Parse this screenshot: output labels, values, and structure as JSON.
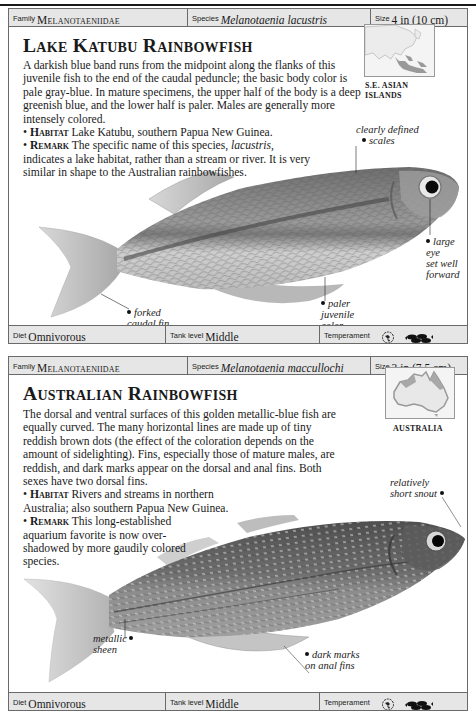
{
  "cards": [
    {
      "family_label": "Family",
      "family": "Melanotaeniidae",
      "species_label": "Species",
      "species": "Melanotaenia lacustris",
      "size_label": "Size",
      "size": "4 in (10 cm)",
      "title": "Lake Katubu Rainbowfish",
      "description": "A darkish blue band runs from the midpoint along the flanks of this juvenile fish to the end of the caudal peduncle; the basic body color is pale gray-blue. In mature specimens, the upper half of the body is a deep greenish blue, and the lower half is paler. Males are generally more intensely colored.",
      "habitat_label": "Habitat",
      "habitat": "Lake Katubu, southern Papua New Guinea.",
      "remark_label": "Remark",
      "remark_pre": "The specific name of this species, ",
      "remark_italic": "lacustris",
      "remark_post": ", indicates a lake habitat, rather than a stream or river. It is very similar in shape to the Australian rainbowfishes.",
      "map_label_1": "S.E. ASIAN",
      "map_label_2": "ISLANDS",
      "annotations": {
        "scales_1": "clearly defined",
        "scales_2": "scales",
        "eye_1": "large eye",
        "eye_2": "set well",
        "eye_3": "forward",
        "color_1": "paler",
        "color_2": "juvenile",
        "color_3": "color",
        "fin_1": "forked",
        "fin_2": "caudal fin"
      },
      "diet_label": "Diet",
      "diet": "Omnivorous",
      "tank_label": "Tank level",
      "tank": "Middle",
      "temperament_label": "Temperament",
      "temperament_icons": [
        "community-fish-icon",
        "school-of-fish-icon"
      ]
    },
    {
      "family_label": "Family",
      "family": "Melanotaeniidae",
      "species_label": "Species",
      "species": "Melanotaenia maccullochi",
      "size_label": "Size",
      "size": "3 in (7.5 cm)",
      "title": "Australian Rainbowfish",
      "description": "The dorsal and ventral surfaces of this golden metallic-blue fish are equally curved. The many horizontal lines are made up of tiny reddish brown dots (the effect of the coloration depends on the amount of sidelighting). Fins, especially those of mature males, are reddish, and dark marks appear on the dorsal and anal fins. Both sexes have two dorsal fins.",
      "habitat_label": "Habitat",
      "habitat": "Rivers and streams in northern Australia; also southern Papua New Guinea.",
      "remark_label": "Remark",
      "remark": "This long-established aquarium favorite is now over-shadowed by more gaudily colored species.",
      "map_label_1": "AUSTRALIA",
      "annotations": {
        "snout_1": "relatively",
        "snout_2": "short snout",
        "sheen_1": "metallic",
        "sheen_2": "sheen",
        "marks_1": "dark marks",
        "marks_2": "on anal fins"
      },
      "diet_label": "Diet",
      "diet": "Omnivorous",
      "tank_label": "Tank level",
      "tank": "Middle",
      "temperament_label": "Temperament",
      "temperament_icons": [
        "community-fish-icon",
        "school-of-fish-icon"
      ]
    }
  ]
}
